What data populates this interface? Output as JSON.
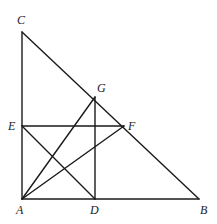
{
  "diagram": {
    "points": {
      "A": {
        "label": "A",
        "x": 22,
        "y": 199,
        "lx": 16,
        "ly": 214
      },
      "B": {
        "label": "B",
        "x": 199,
        "y": 199,
        "lx": 200,
        "ly": 214
      },
      "C": {
        "label": "C",
        "x": 22,
        "y": 32,
        "lx": 17,
        "ly": 24
      },
      "D": {
        "label": "D",
        "x": 95,
        "y": 199,
        "lx": 90,
        "ly": 214
      },
      "E": {
        "label": "E",
        "x": 22,
        "y": 126,
        "lx": 8,
        "ly": 130
      },
      "F": {
        "label": "F",
        "x": 124,
        "y": 126,
        "lx": 128,
        "ly": 130
      },
      "G": {
        "label": "G",
        "x": 95,
        "y": 97,
        "lx": 97,
        "ly": 92
      }
    },
    "segments": [
      [
        "A",
        "C"
      ],
      [
        "A",
        "B"
      ],
      [
        "C",
        "B"
      ],
      [
        "E",
        "F"
      ],
      [
        "G",
        "D"
      ],
      [
        "E",
        "D"
      ],
      [
        "A",
        "G"
      ],
      [
        "A",
        "F"
      ]
    ]
  }
}
